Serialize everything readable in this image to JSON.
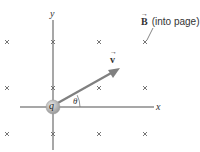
{
  "diagram": {
    "field_label": {
      "symbol": "B",
      "vector_arrow": "→",
      "text": "(into page)"
    },
    "velocity_label": {
      "symbol": "v",
      "vector_arrow": "→"
    },
    "charge_label": "q",
    "angle_label": "θ",
    "axes": {
      "x_label": "x",
      "y_label": "y"
    },
    "field_markers": {
      "glyph": "×",
      "meaning": "magnetic field into page",
      "grid_columns": 4,
      "grid_rows": 3
    },
    "colors": {
      "axis": "#8a8a8a",
      "vector": "#808080",
      "charge_fill": "#b5b5b5",
      "text": "#333333",
      "marker": "#555555"
    }
  }
}
